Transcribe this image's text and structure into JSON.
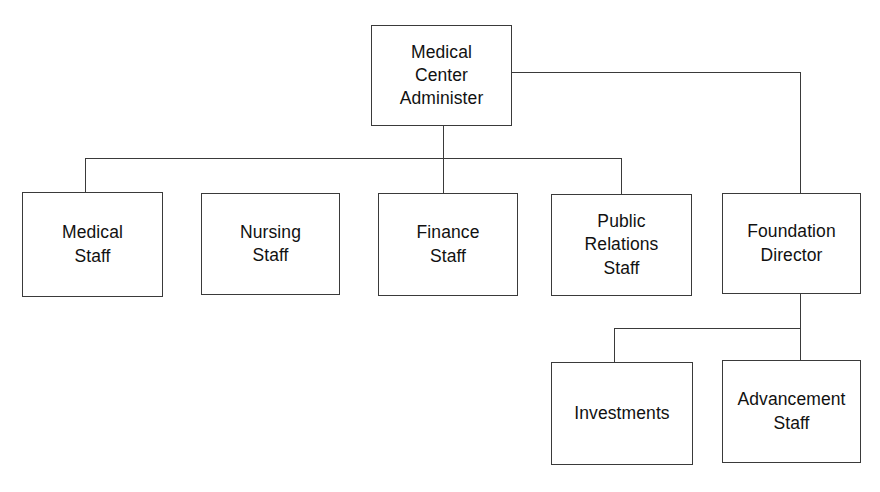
{
  "diagram": {
    "type": "organizational-chart",
    "background_color": "#ffffff",
    "line_color": "#3a3a3a",
    "text_color": "#111111"
  },
  "nodes": {
    "root": {
      "label": "Medical\nCenter\nAdminister",
      "level": 0
    },
    "medical_staff": {
      "label": "Medical\nStaff",
      "level": 1
    },
    "nursing_staff": {
      "label": "Nursing\nStaff",
      "level": 1
    },
    "finance_staff": {
      "label": "Finance\nStaff",
      "level": 1
    },
    "public_relations_staff": {
      "label": "Public\nRelations\nStaff",
      "level": 1
    },
    "foundation_director": {
      "label": "Foundation\nDirector",
      "level": 1
    },
    "investments": {
      "label": "Investments",
      "level": 2
    },
    "advancement_staff": {
      "label": "Advancement\nStaff",
      "level": 2
    }
  },
  "edges": [
    {
      "from": "root",
      "to": "medical_staff"
    },
    {
      "from": "root",
      "to": "finance_staff"
    },
    {
      "from": "root",
      "to": "public_relations_staff"
    },
    {
      "from": "root",
      "to": "foundation_director"
    },
    {
      "from": "foundation_director",
      "to": "investments"
    },
    {
      "from": "foundation_director",
      "to": "advancement_staff"
    }
  ]
}
